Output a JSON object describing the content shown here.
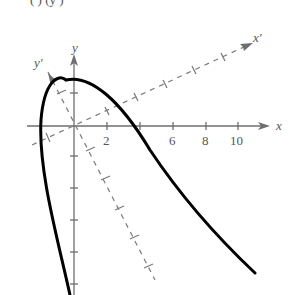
{
  "figure": {
    "top_caption_fragment": "(   )                (y         )",
    "axes": {
      "x_label": "x",
      "y_label": "y",
      "x_prime_label": "x′",
      "y_prime_label": "y′",
      "x_tick_labels": [
        "2",
        "6",
        "8",
        "10"
      ]
    },
    "colors": {
      "axis": "#6e6e6e",
      "rotated_axis": "#7a7a7a",
      "curve": "#000000"
    }
  }
}
